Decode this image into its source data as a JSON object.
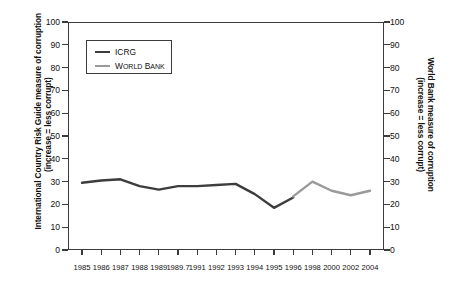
{
  "chart_data": {
    "type": "line",
    "title": "",
    "xlabel": "",
    "ylabel_left_line1": "International Country Risk Guide measure of corruption",
    "ylabel_left_line2": "(increase = less corrupt)",
    "ylabel_right_line1": "World Bank measure of corruption",
    "ylabel_right_line2": "(increase = less corrupt)",
    "ylim": [
      0,
      100
    ],
    "yticks": [
      0,
      10,
      20,
      30,
      40,
      50,
      60,
      70,
      80,
      90,
      100
    ],
    "yticks_right": [
      0,
      10,
      20,
      30,
      40,
      50,
      60,
      70,
      80,
      90,
      100
    ],
    "xtick_labels": [
      "1985",
      "1986",
      "1987",
      "1988",
      "1989",
      "1989.7",
      "1991",
      "1992",
      "1993",
      "1994",
      "1995",
      "1996",
      "1998",
      "2000",
      "2002",
      "2004"
    ],
    "grid": false,
    "legend_position": "upper-left-inside",
    "series": [
      {
        "name": "ICRG",
        "color": "#3d3d3d",
        "x": [
          "1985",
          "1986",
          "1987",
          "1988",
          "1989",
          "1989.7",
          "1991",
          "1992",
          "1993",
          "1994",
          "1995",
          "1996"
        ],
        "values": [
          29.5,
          30.5,
          31.0,
          28.0,
          26.5,
          28.0,
          28.0,
          28.5,
          29.0,
          24.5,
          18.5,
          23.0
        ]
      },
      {
        "name": "World Bank",
        "color": "#9a9a9a",
        "x": [
          "1996",
          "1998",
          "2000",
          "2002",
          "2004"
        ],
        "values": [
          23.5,
          30.0,
          26.0,
          24.0,
          26.0
        ]
      }
    ],
    "legend": [
      {
        "label": "ICRG",
        "label_caps": "",
        "color": "#3d3d3d"
      },
      {
        "label": "World Bank",
        "label_first": "W",
        "label_rest": "ORLD ",
        "label_first2": "B",
        "label_rest2": "ANK",
        "color": "#9a9a9a"
      }
    ]
  },
  "legend": {
    "item1_label": "ICRG",
    "item2_w": "W",
    "item2_orld": "ORLD",
    "item2_b": "B",
    "item2_ank": "ANK"
  },
  "axis": {
    "left_title_line1": "International Country Risk Guide measure of corruption",
    "left_title_line2": "(increase = less corrupt)",
    "right_title_line1": "World Bank measure of corruption",
    "right_title_line2": "(increase = less corrupt)"
  }
}
